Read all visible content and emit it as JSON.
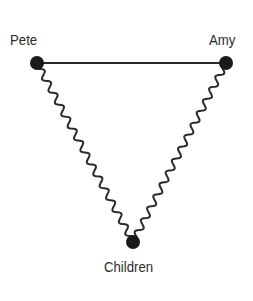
{
  "diagram": {
    "nodes": [
      {
        "id": "pete",
        "label": "Pete",
        "x": 37,
        "y": 63
      },
      {
        "id": "amy",
        "label": "Amy",
        "x": 226,
        "y": 63
      },
      {
        "id": "children",
        "label": "Children",
        "x": 133,
        "y": 242
      }
    ],
    "edges": [
      {
        "from": "pete",
        "to": "amy",
        "style": "straight"
      },
      {
        "from": "pete",
        "to": "children",
        "style": "wavy"
      },
      {
        "from": "amy",
        "to": "children",
        "style": "wavy"
      }
    ],
    "colors": {
      "node": "#1a1a1a",
      "line": "#2a2a2a",
      "label": "#2a2a2a"
    }
  }
}
